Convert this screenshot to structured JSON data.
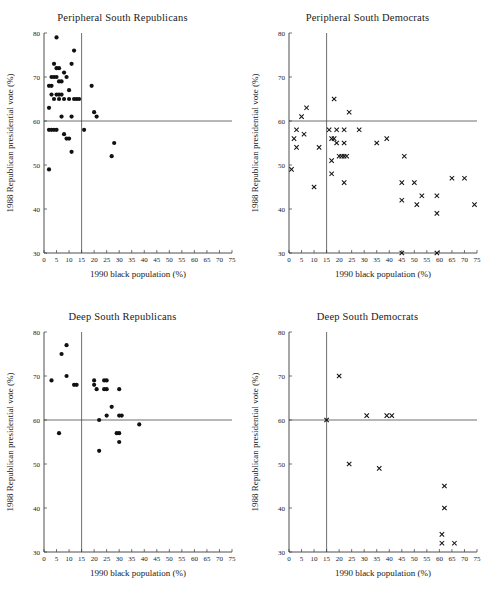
{
  "figure": {
    "xlabel": "1990 black population (%)",
    "ylabel": "1988 Republican presidential vote (%)",
    "xticks": [
      0,
      5,
      10,
      15,
      20,
      25,
      30,
      35,
      40,
      45,
      50,
      55,
      60,
      65,
      70,
      75
    ],
    "yticks": [
      30,
      40,
      50,
      60,
      70,
      80
    ],
    "xlim": [
      0,
      75
    ],
    "ylim": [
      30,
      80
    ],
    "reference_lines": {
      "vertical_x": 15,
      "horizontal_y": 60
    },
    "colors": {
      "marker": "#111111",
      "axis": "#3a3a3a",
      "reference": "#4a4a4a",
      "background": "#ffffff"
    }
  },
  "chart_data": [
    {
      "type": "scatter",
      "title": "Peripheral  South Republicans",
      "xlabel": "1990 black population (%)",
      "ylabel": "1988 Republican presidential vote (%)",
      "xlim": [
        0,
        75
      ],
      "ylim": [
        30,
        80
      ],
      "marker": "filled-circle",
      "grid": false,
      "legend": "none",
      "reference_lines": {
        "vertical_x": 15,
        "horizontal_y": 60
      },
      "points": [
        [
          5,
          79
        ],
        [
          4,
          73
        ],
        [
          5,
          72
        ],
        [
          6,
          72
        ],
        [
          3,
          70
        ],
        [
          4,
          70
        ],
        [
          5,
          70
        ],
        [
          6,
          69
        ],
        [
          7,
          69
        ],
        [
          3,
          68
        ],
        [
          2,
          68
        ],
        [
          9,
          70
        ],
        [
          11,
          73
        ],
        [
          12,
          76
        ],
        [
          8,
          71
        ],
        [
          5,
          66
        ],
        [
          6,
          66
        ],
        [
          3,
          66
        ],
        [
          7,
          66
        ],
        [
          4,
          65
        ],
        [
          6,
          65
        ],
        [
          2,
          63
        ],
        [
          8,
          65
        ],
        [
          10,
          65
        ],
        [
          12,
          65
        ],
        [
          13,
          65
        ],
        [
          14,
          65
        ],
        [
          10,
          67
        ],
        [
          19,
          68
        ],
        [
          7,
          61
        ],
        [
          11,
          61
        ],
        [
          20,
          62
        ],
        [
          21,
          61
        ],
        [
          2,
          58
        ],
        [
          3,
          58
        ],
        [
          4,
          58
        ],
        [
          5,
          58
        ],
        [
          8,
          57
        ],
        [
          9,
          56
        ],
        [
          10,
          56
        ],
        [
          16,
          58
        ],
        [
          11,
          53
        ],
        [
          27,
          52
        ],
        [
          28,
          55
        ],
        [
          2,
          49
        ]
      ]
    },
    {
      "type": "scatter",
      "title": "Peripheral South Democrats",
      "xlabel": "1990 black population (%)",
      "ylabel": "1988 Republican presidential vote (%)",
      "xlim": [
        0,
        75
      ],
      "ylim": [
        30,
        80
      ],
      "marker": "x-cross",
      "grid": false,
      "legend": "none",
      "reference_lines": {
        "vertical_x": 15,
        "horizontal_y": 60
      },
      "points": [
        [
          18,
          65
        ],
        [
          24,
          62
        ],
        [
          7,
          63
        ],
        [
          5,
          61
        ],
        [
          3,
          58
        ],
        [
          6,
          57
        ],
        [
          2,
          56
        ],
        [
          3,
          54
        ],
        [
          1,
          49
        ],
        [
          10,
          45
        ],
        [
          12,
          54
        ],
        [
          16,
          58
        ],
        [
          19,
          58
        ],
        [
          22,
          58
        ],
        [
          28,
          58
        ],
        [
          17,
          56
        ],
        [
          18,
          56
        ],
        [
          19,
          55
        ],
        [
          22,
          55
        ],
        [
          35,
          55
        ],
        [
          39,
          56
        ],
        [
          17,
          51
        ],
        [
          20,
          52
        ],
        [
          21,
          52
        ],
        [
          22,
          52
        ],
        [
          23,
          52
        ],
        [
          17,
          48
        ],
        [
          22,
          46
        ],
        [
          46,
          52
        ],
        [
          45,
          46
        ],
        [
          50,
          46
        ],
        [
          65,
          47
        ],
        [
          70,
          47
        ],
        [
          45,
          42
        ],
        [
          53,
          43
        ],
        [
          59,
          43
        ],
        [
          51,
          41
        ],
        [
          74,
          41
        ],
        [
          59,
          39
        ],
        [
          45,
          30
        ],
        [
          59,
          30
        ]
      ]
    },
    {
      "type": "scatter",
      "title": "Deep South Republicans",
      "xlabel": "1990 black population (%)",
      "ylabel": "1988 Republican presidential vote (%)",
      "xlim": [
        0,
        75
      ],
      "ylim": [
        30,
        80
      ],
      "marker": "filled-circle",
      "grid": false,
      "legend": "none",
      "reference_lines": {
        "vertical_x": 15,
        "horizontal_y": 60
      },
      "points": [
        [
          9,
          77
        ],
        [
          7,
          75
        ],
        [
          9,
          70
        ],
        [
          3,
          69
        ],
        [
          12,
          68
        ],
        [
          13,
          68
        ],
        [
          20,
          69
        ],
        [
          20,
          68
        ],
        [
          21,
          67
        ],
        [
          24,
          69
        ],
        [
          25,
          69
        ],
        [
          24,
          67
        ],
        [
          25,
          67
        ],
        [
          30,
          67
        ],
        [
          27,
          63
        ],
        [
          25,
          61
        ],
        [
          30,
          61
        ],
        [
          31,
          61
        ],
        [
          22,
          60
        ],
        [
          38,
          59
        ],
        [
          6,
          57
        ],
        [
          29,
          57
        ],
        [
          30,
          57
        ],
        [
          30,
          55
        ],
        [
          22,
          53
        ]
      ]
    },
    {
      "type": "scatter",
      "title": "Deep South Democrats",
      "xlabel": "1990 black population (%)",
      "ylabel": "1988 Republican presidential vote (%)",
      "xlim": [
        0,
        75
      ],
      "ylim": [
        30,
        80
      ],
      "marker": "x-cross",
      "grid": false,
      "legend": "none",
      "reference_lines": {
        "vertical_x": 15,
        "horizontal_y": 60
      },
      "points": [
        [
          20,
          70
        ],
        [
          31,
          61
        ],
        [
          39,
          61
        ],
        [
          41,
          61
        ],
        [
          15,
          60
        ],
        [
          24,
          50
        ],
        [
          36,
          49
        ],
        [
          62,
          45
        ],
        [
          62,
          40
        ],
        [
          61,
          34
        ],
        [
          61,
          32
        ],
        [
          66,
          32
        ]
      ]
    }
  ]
}
